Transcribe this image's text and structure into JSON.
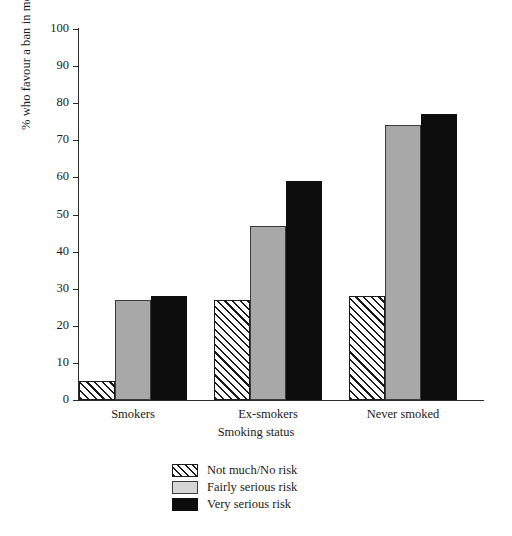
{
  "chart_data": {
    "type": "bar",
    "title": "",
    "xlabel": "Smoking status",
    "ylabel": "% who favour a ban in most sites",
    "categories": [
      "Smokers",
      "Ex-smokers",
      "Never smoked"
    ],
    "series": [
      {
        "name": "Not much/No risk",
        "values": [
          5,
          27,
          28
        ],
        "fill": "hatch",
        "color": "#ffffff"
      },
      {
        "name": "Fairly serious risk",
        "values": [
          27,
          47,
          74
        ],
        "fill": "gray",
        "color": "#a8a8a8"
      },
      {
        "name": "Very serious risk",
        "values": [
          28,
          59,
          77
        ],
        "fill": "black",
        "color": "#0d0d0d"
      }
    ],
    "ylim": [
      0,
      100
    ],
    "yticks": [
      0,
      10,
      20,
      30,
      40,
      50,
      60,
      70,
      80,
      90,
      100
    ],
    "ytick_labels": [
      "0",
      "10",
      "20",
      "30",
      "40",
      "50",
      "60",
      "70",
      "80",
      "90",
      "100"
    ],
    "grid": false,
    "legend_position": "bottom-center"
  },
  "axes": {
    "y_title": "% who favour a ban in most sites",
    "x_title": "Smoking status"
  },
  "legend": {
    "items": [
      {
        "label": "Not much/No risk"
      },
      {
        "label": "Fairly serious risk"
      },
      {
        "label": "Very serious risk"
      }
    ]
  }
}
